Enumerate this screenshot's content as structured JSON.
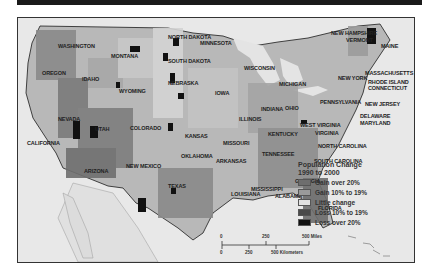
{
  "map": {
    "title": "",
    "states": [
      {
        "name": "WASHINGTON",
        "x": 40,
        "y": 25
      },
      {
        "name": "OREGON",
        "x": 24,
        "y": 52
      },
      {
        "name": "IDAHO",
        "x": 64,
        "y": 58
      },
      {
        "name": "MONTANA",
        "x": 93,
        "y": 35
      },
      {
        "name": "WYOMING",
        "x": 101,
        "y": 70
      },
      {
        "name": "NORTH DAKOTA",
        "x": 150,
        "y": 16
      },
      {
        "name": "SOUTH DAKOTA",
        "x": 150,
        "y": 40
      },
      {
        "name": "NEBRASKA",
        "x": 150,
        "y": 62
      },
      {
        "name": "MINNESOTA",
        "x": 182,
        "y": 22
      },
      {
        "name": "WISCONSIN",
        "x": 226,
        "y": 47
      },
      {
        "name": "MICHIGAN",
        "x": 261,
        "y": 63
      },
      {
        "name": "IOWA",
        "x": 197,
        "y": 72
      },
      {
        "name": "ILLINOIS",
        "x": 221,
        "y": 98
      },
      {
        "name": "INDIANA",
        "x": 243,
        "y": 88
      },
      {
        "name": "OHIO",
        "x": 267,
        "y": 87
      },
      {
        "name": "NEVADA",
        "x": 40,
        "y": 98
      },
      {
        "name": "UTAH",
        "x": 77,
        "y": 108
      },
      {
        "name": "COLORADO",
        "x": 112,
        "y": 107
      },
      {
        "name": "KANSAS",
        "x": 167,
        "y": 115
      },
      {
        "name": "MISSOURI",
        "x": 205,
        "y": 122
      },
      {
        "name": "CALIFORNIA",
        "x": 9,
        "y": 122
      },
      {
        "name": "ARIZONA",
        "x": 66,
        "y": 150
      },
      {
        "name": "NEW MEXICO",
        "x": 108,
        "y": 145
      },
      {
        "name": "OKLAHOMA",
        "x": 163,
        "y": 135
      },
      {
        "name": "ARKANSAS",
        "x": 198,
        "y": 140
      },
      {
        "name": "TEXAS",
        "x": 150,
        "y": 165
      },
      {
        "name": "LOUISIANA",
        "x": 213,
        "y": 173
      },
      {
        "name": "KENTUCKY",
        "x": 250,
        "y": 113
      },
      {
        "name": "TENNESSEE",
        "x": 244,
        "y": 133
      },
      {
        "name": "WEST VIRGINIA",
        "x": 282,
        "y": 104
      },
      {
        "name": "VIRGINIA",
        "x": 297,
        "y": 112
      },
      {
        "name": "NORTH CAROLINA",
        "x": 300,
        "y": 125
      },
      {
        "name": "SOUTH CAROLINA",
        "x": 296,
        "y": 140
      },
      {
        "name": "GEORGIA",
        "x": 277,
        "y": 160
      },
      {
        "name": "ALABAMA",
        "x": 257,
        "y": 175
      },
      {
        "name": "MISSISSIPPI",
        "x": 233,
        "y": 168
      },
      {
        "name": "FLORIDA",
        "x": 300,
        "y": 187
      },
      {
        "name": "PENNSYLVANIA",
        "x": 302,
        "y": 81
      },
      {
        "name": "NEW YORK",
        "x": 320,
        "y": 57
      },
      {
        "name": "NEW HAMPSHIRE",
        "x": 313,
        "y": 12
      },
      {
        "name": "VERMONT",
        "x": 328,
        "y": 19
      },
      {
        "name": "MAINE",
        "x": 363,
        "y": 25
      },
      {
        "name": "MASSACHUSETTS",
        "x": 347,
        "y": 52
      },
      {
        "name": "RHODE ISLAND",
        "x": 350,
        "y": 61
      },
      {
        "name": "CONNECTICUT",
        "x": 350,
        "y": 67
      },
      {
        "name": "NEW JERSEY",
        "x": 347,
        "y": 83
      },
      {
        "name": "DELAWARE",
        "x": 342,
        "y": 95
      },
      {
        "name": "MARYLAND",
        "x": 342,
        "y": 102
      }
    ]
  },
  "legend": {
    "title_line1": "Population Change",
    "title_line2": "1990 to 2000",
    "items": [
      {
        "label": "Gain over 20%",
        "color": "#6e6e6e"
      },
      {
        "label": "Gain 10% to 19%",
        "color": "#9a9a9a"
      },
      {
        "label": "Little change",
        "color": "#e0e0e0"
      },
      {
        "label": "Loss 10% to 19%",
        "color": "#4a4a4a"
      },
      {
        "label": "Loss over 20%",
        "color": "#111111"
      }
    ]
  },
  "scale": {
    "miles": {
      "zero": "0",
      "mid": "250",
      "end": "500 Miles"
    },
    "km": {
      "zero": "0",
      "mid": "250",
      "end": "500 Kilometers"
    }
  },
  "colors": {
    "background": "#e6e6e6",
    "land_base": "#b5b5b5",
    "border": "#1a1a1a"
  }
}
